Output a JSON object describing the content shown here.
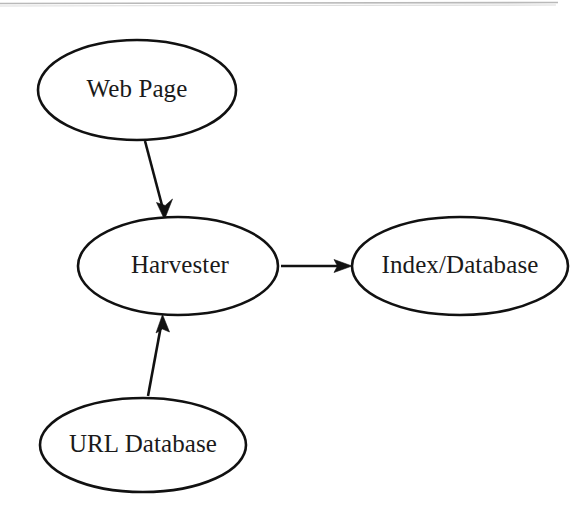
{
  "document": {
    "background_color": "#ffffff",
    "ink_color": "#111111",
    "page_edge_color": "#b9b9b9"
  },
  "chart_data": {
    "type": "diagram",
    "title": "",
    "nodes": [
      {
        "id": "web-page",
        "label": "Web Page",
        "shape": "ellipse",
        "cx": 137,
        "cy": 90,
        "rx": 99,
        "ry": 50
      },
      {
        "id": "harvester",
        "label": "Harvester",
        "shape": "ellipse",
        "cx": 178,
        "cy": 266,
        "rx": 100,
        "ry": 49
      },
      {
        "id": "index-database",
        "label": "Index/Database",
        "shape": "ellipse",
        "cx": 460,
        "cy": 266,
        "rx": 108,
        "ry": 49
      },
      {
        "id": "url-database",
        "label": "URL Database",
        "shape": "ellipse",
        "cx": 143,
        "cy": 445,
        "rx": 103,
        "ry": 47
      }
    ],
    "edges": [
      {
        "id": "edge-webpage-harvester",
        "from": "web-page",
        "to": "harvester",
        "label": "",
        "directed": true,
        "x1": 145,
        "y1": 141,
        "x2": 164,
        "y2": 218
      },
      {
        "id": "edge-urldatabase-harvester",
        "from": "url-database",
        "to": "harvester",
        "label": "",
        "directed": true,
        "x1": 148,
        "y1": 396,
        "x2": 162,
        "y2": 315
      },
      {
        "id": "edge-harvester-indexdatabase",
        "from": "harvester",
        "to": "index-database",
        "label": "",
        "directed": true,
        "x1": 281,
        "y1": 266,
        "x2": 351,
        "y2": 266
      }
    ]
  },
  "labels": {
    "web_page": "Web Page",
    "harvester": "Harvester",
    "index_database": "Index/Database",
    "url_database": "URL Database"
  }
}
